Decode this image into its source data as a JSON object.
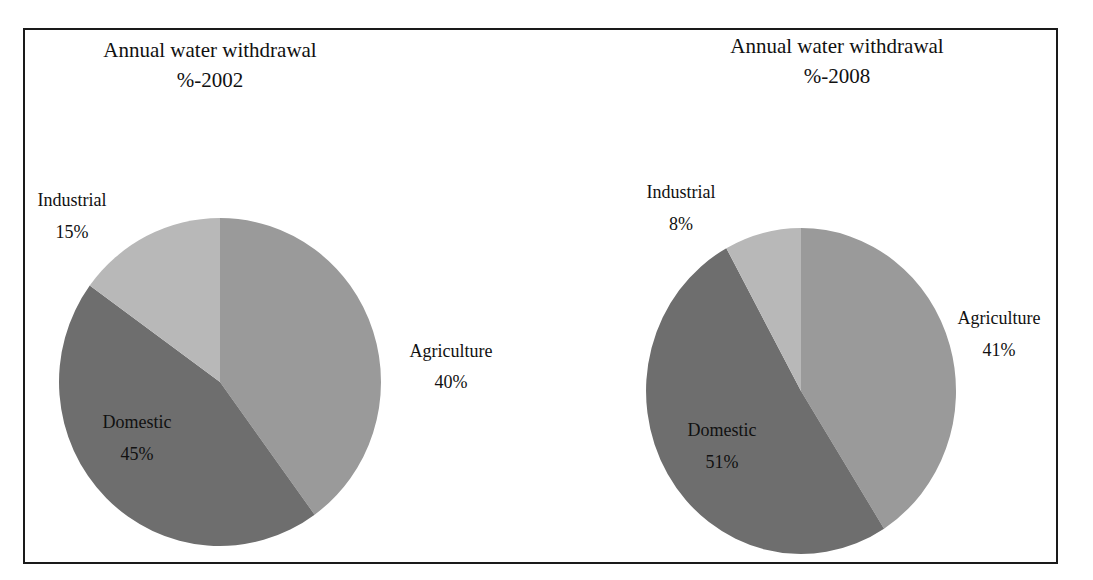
{
  "chart_data": [
    {
      "type": "pie",
      "title": "Annual water withdrawal %-2002",
      "title_lines": [
        "Annual water withdrawal",
        "%-2002"
      ],
      "categories": [
        "Agriculture",
        "Domestic",
        "Industrial"
      ],
      "values": [
        40,
        45,
        15
      ],
      "value_labels": [
        "40%",
        "45%",
        "15%"
      ],
      "colors": [
        "#9a9a9a",
        "#6e6e6e",
        "#b8b8b8"
      ],
      "start_angle": "12 o'clock, clockwise",
      "legend": "none (data labels)"
    },
    {
      "type": "pie",
      "title": "Annual water withdrawal %-2008",
      "title_lines": [
        "Annual water withdrawal",
        "%-2008"
      ],
      "categories": [
        "Agriculture",
        "Domestic",
        "Industrial"
      ],
      "values": [
        41,
        51,
        8
      ],
      "value_labels": [
        "41%",
        "51%",
        "8%"
      ],
      "colors": [
        "#9a9a9a",
        "#6e6e6e",
        "#b8b8b8"
      ],
      "start_angle": "12 o'clock, clockwise",
      "legend": "none (data labels)"
    }
  ],
  "charts": {
    "left": {
      "title_line1": "Annual water withdrawal",
      "title_line2": "%-2002",
      "labels": {
        "industrial": {
          "name": "Industrial",
          "value": "15%"
        },
        "agriculture": {
          "name": "Agriculture",
          "value": "40%"
        },
        "domestic": {
          "name": "Domestic",
          "value": "45%"
        }
      }
    },
    "right": {
      "title_line1": "Annual water withdrawal",
      "title_line2": "%-2008",
      "labels": {
        "industrial": {
          "name": "Industrial",
          "value": "8%"
        },
        "agriculture": {
          "name": "Agriculture",
          "value": "41%"
        },
        "domestic": {
          "name": "Domestic",
          "value": "51%"
        }
      }
    }
  }
}
